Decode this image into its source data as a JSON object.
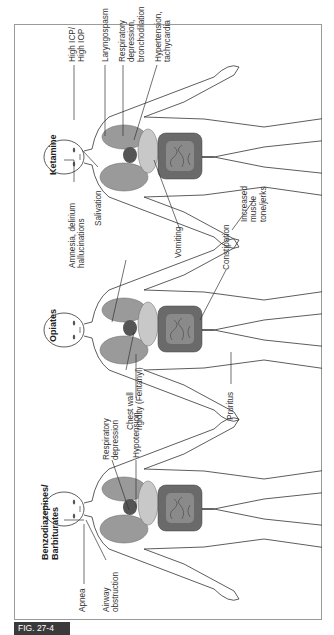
{
  "figure_label": "FIG. 27-4",
  "colors": {
    "figure_tag_bg": "#3a3a3a",
    "frame_border": "#9a9a9a",
    "lung_fill": "#9a9a9a",
    "organ_fill": "#c8c8c8",
    "intestine_fill": "#6a6a6a",
    "line": "#333333"
  },
  "panels": [
    {
      "title": "Benzodiazepines/\nBarbiturates",
      "labels": {
        "apnea": "Apnea",
        "airway": "Airway\nobstruction",
        "resp": "Respiratory\ndepression",
        "hypo": "Hypotension"
      }
    },
    {
      "title": "Opiates",
      "labels": {
        "chest": "Chest wall\nrigidity (Fentanyl)",
        "pruritus": "Pruritus",
        "constipation": "Constipation",
        "vomiting": "Vomiting"
      }
    },
    {
      "title": "Ketamine",
      "labels": {
        "amnesia": "Amnesia, delirium\nhallucinations",
        "salivation": "Salivation",
        "icp": "High ICP/\nHigh IOP",
        "laryngospasm": "Laryngospasm",
        "resp": "Respiratory\ndepression,\nbronchodilation",
        "htn": "Hypertension,\ntachycardia",
        "muscle": "Increased\nmuscle\ntone/jerks"
      }
    }
  ]
}
